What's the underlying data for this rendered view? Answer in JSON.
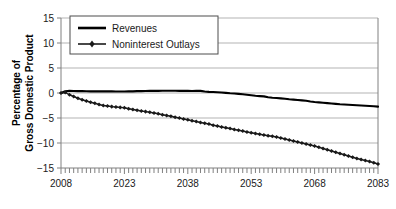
{
  "chart_data": {
    "type": "line",
    "title": "",
    "xlabel": "",
    "ylabel": "Percentage of Gross Domestic Product",
    "ylabel_line1": "Percentage of",
    "ylabel_line2": "Gross Domestic Product",
    "xlim": [
      2008,
      2083
    ],
    "ylim": [
      -15,
      15
    ],
    "yticks": [
      15,
      10,
      5,
      0,
      -5,
      -10,
      -15
    ],
    "ytick_labels": [
      "15",
      "10",
      "5",
      "0",
      "−5",
      "−10",
      "−15"
    ],
    "xticks": [
      2008,
      2023,
      2038,
      2053,
      2068,
      2083
    ],
    "xtick_labels": [
      "2008",
      "2023",
      "2038",
      "2053",
      "2068",
      "2083"
    ],
    "minor_xtick_interval": 1,
    "grid": "horizontal",
    "legend_position": "top-left-inside",
    "legend_border": true,
    "axis_color": "#808080",
    "grid_color": "#b3b3b3",
    "series": [
      {
        "name": "Revenues",
        "color": "#000000",
        "marker": "none",
        "line_width": 2.2,
        "x": [
          2008,
          2009,
          2010,
          2011,
          2012,
          2013,
          2014,
          2015,
          2016,
          2017,
          2018,
          2019,
          2020,
          2021,
          2022,
          2023,
          2024,
          2025,
          2026,
          2027,
          2028,
          2029,
          2030,
          2031,
          2032,
          2033,
          2034,
          2035,
          2036,
          2037,
          2038,
          2039,
          2040,
          2041,
          2042,
          2043,
          2044,
          2045,
          2046,
          2047,
          2048,
          2049,
          2050,
          2051,
          2052,
          2053,
          2054,
          2055,
          2056,
          2057,
          2058,
          2059,
          2060,
          2061,
          2062,
          2063,
          2064,
          2065,
          2066,
          2067,
          2068,
          2069,
          2070,
          2071,
          2072,
          2073,
          2074,
          2075,
          2076,
          2077,
          2078,
          2079,
          2080,
          2081,
          2082,
          2083
        ],
        "values": [
          0.0,
          0.35,
          0.42,
          0.4,
          0.38,
          0.36,
          0.35,
          0.34,
          0.33,
          0.32,
          0.32,
          0.31,
          0.31,
          0.3,
          0.3,
          0.3,
          0.31,
          0.33,
          0.36,
          0.38,
          0.4,
          0.42,
          0.43,
          0.44,
          0.45,
          0.45,
          0.45,
          0.45,
          0.44,
          0.44,
          0.45,
          0.4,
          0.45,
          0.42,
          0.3,
          0.22,
          0.2,
          0.15,
          0.1,
          0.02,
          -0.05,
          -0.1,
          -0.18,
          -0.25,
          -0.35,
          -0.45,
          -0.55,
          -0.62,
          -0.68,
          -0.85,
          -0.95,
          -1.0,
          -1.08,
          -1.15,
          -1.25,
          -1.32,
          -1.4,
          -1.48,
          -1.55,
          -1.7,
          -1.8,
          -1.88,
          -1.95,
          -2.02,
          -2.1,
          -2.18,
          -2.25,
          -2.3,
          -2.35,
          -2.4,
          -2.45,
          -2.5,
          -2.55,
          -2.6,
          -2.65,
          -2.72
        ]
      },
      {
        "name": "Noninterest Outlays",
        "color": "#1a1a1a",
        "marker": "diamond",
        "line_width": 1.4,
        "x": [
          2008,
          2009,
          2010,
          2011,
          2012,
          2013,
          2014,
          2015,
          2016,
          2017,
          2018,
          2019,
          2020,
          2021,
          2022,
          2023,
          2024,
          2025,
          2026,
          2027,
          2028,
          2029,
          2030,
          2031,
          2032,
          2033,
          2034,
          2035,
          2036,
          2037,
          2038,
          2039,
          2040,
          2041,
          2042,
          2043,
          2044,
          2045,
          2046,
          2047,
          2048,
          2049,
          2050,
          2051,
          2052,
          2053,
          2054,
          2055,
          2056,
          2057,
          2058,
          2059,
          2060,
          2061,
          2062,
          2063,
          2064,
          2065,
          2066,
          2067,
          2068,
          2069,
          2070,
          2071,
          2072,
          2073,
          2074,
          2075,
          2076,
          2077,
          2078,
          2079,
          2080,
          2081,
          2082,
          2083
        ],
        "values": [
          0.0,
          0.1,
          -0.35,
          -0.7,
          -1.05,
          -1.35,
          -1.6,
          -1.85,
          -2.05,
          -2.3,
          -2.5,
          -2.6,
          -2.72,
          -2.8,
          -2.88,
          -2.95,
          -3.15,
          -3.3,
          -3.45,
          -3.6,
          -3.72,
          -3.85,
          -4.0,
          -4.15,
          -4.35,
          -4.5,
          -4.65,
          -4.85,
          -5.0,
          -5.2,
          -5.35,
          -5.55,
          -5.7,
          -5.9,
          -6.05,
          -6.2,
          -6.45,
          -6.6,
          -6.8,
          -6.95,
          -7.1,
          -7.3,
          -7.45,
          -7.6,
          -7.8,
          -7.95,
          -8.1,
          -8.25,
          -8.4,
          -8.55,
          -8.65,
          -8.8,
          -9.0,
          -9.2,
          -9.4,
          -9.6,
          -9.8,
          -10.0,
          -10.2,
          -10.4,
          -10.6,
          -10.85,
          -11.1,
          -11.35,
          -11.6,
          -11.85,
          -12.1,
          -12.35,
          -12.6,
          -12.85,
          -13.1,
          -13.3,
          -13.5,
          -13.7,
          -13.95,
          -14.2
        ]
      }
    ]
  },
  "legend": {
    "items": [
      {
        "label": "Revenues"
      },
      {
        "label": "Noninterest Outlays"
      }
    ]
  }
}
